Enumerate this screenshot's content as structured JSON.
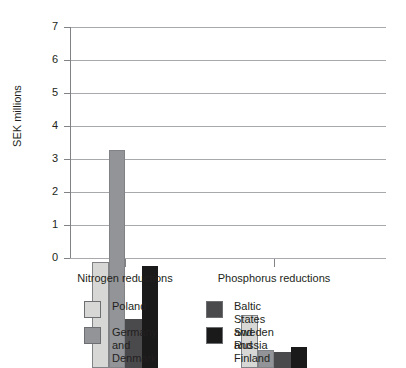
{
  "chart_data": {
    "type": "bar",
    "title": "",
    "subtitle": "",
    "xlabel": "",
    "ylabel": "SEK millions",
    "categories": [
      "Nitrogen reductions",
      "Phosphorus reductions"
    ],
    "series": [
      {
        "name": "Poland",
        "values": [
          3.2,
          1.6
        ],
        "color": "#d7d8d6"
      },
      {
        "name": "Germany and Denmark",
        "values": [
          6.6,
          0.55
        ],
        "color": "#929497"
      },
      {
        "name": "Baltic States and Russia",
        "values": [
          1.5,
          0.5
        ],
        "color": "#4a4a4c"
      },
      {
        "name": "Sweden and Finland",
        "values": [
          3.1,
          0.65
        ],
        "color": "#1a1a1a"
      }
    ],
    "ylim": [
      0,
      7
    ],
    "y_ticks": [
      0,
      1,
      2,
      3,
      4,
      5,
      6,
      7
    ],
    "y_tick_labels": [
      "0",
      "1",
      "2",
      "3",
      "4",
      "5",
      "6",
      "7"
    ],
    "grid": true,
    "grid_color": "#a7a9ac",
    "legend_position": "bottom",
    "legend_columns": 2,
    "background": "#ffffff",
    "text_color": "#231f20"
  },
  "legend": {
    "left_column": [
      {
        "label": "Poland"
      },
      {
        "label": "Germany and\nDenmark"
      }
    ],
    "right_column": [
      {
        "label": "Baltic States and Russia"
      },
      {
        "label": "Sweden and Finland"
      }
    ]
  }
}
